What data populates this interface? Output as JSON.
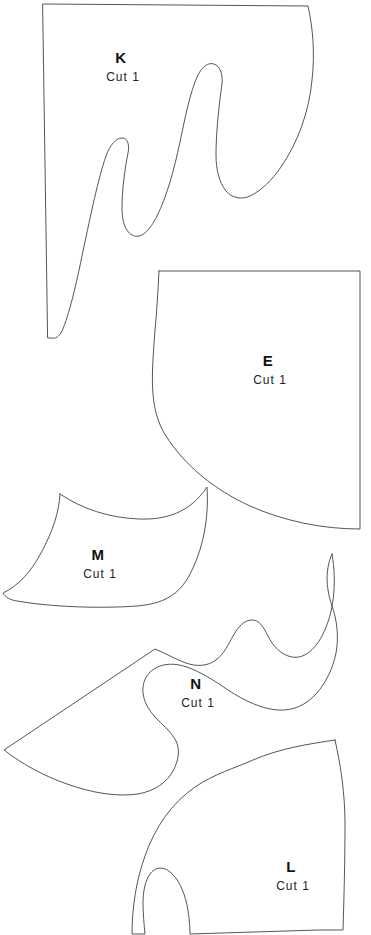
{
  "sheet": {
    "title": "Pattern Pieces Sheet",
    "background_color": "#ffffff",
    "line_color": "#555555",
    "text_color": "#111111",
    "width": 371,
    "height": 935
  },
  "pieces": [
    {
      "id": "piece-k",
      "letter": "K",
      "cut_note": "Cut 1",
      "letter_x": 121,
      "letter_y": 63,
      "cut_x": 123,
      "cut_y": 81,
      "path": "M 43 4 L 308 6 C 313 28 315 54 312 80 C 309 112 298 142 281 167 C 272 180 261 191 250 196 C 241 200 232 198 226 191 C 219 182 216 169 216 155 C 216 132 219 105 222 84 C 223 74 220 66 214 64 C 208 62 202 67 198 75 C 190 92 185 118 180 142 C 174 170 167 196 157 216 C 150 230 141 240 132 235 C 125 231 122 221 122 208 C 122 189 125 168 128 153 C 130 144 127 138 122 138 C 116 138 110 145 106 156 C 98 179 91 214 83 251 C 76 286 69 315 62 331 C 59 337 55 339 52 338 L 48 338 Z"
    },
    {
      "id": "piece-e",
      "letter": "E",
      "cut_note": "Cut 1",
      "letter_x": 268,
      "letter_y": 366,
      "cut_x": 270,
      "cut_y": 384,
      "path": "M 159 271 L 360 271 L 360 529 C 322 529 284 521 250 506 C 215 490 185 466 166 436 C 148 408 152 373 155 330 C 157 310 158 290 159 271 Z"
    },
    {
      "id": "piece-m",
      "letter": "M",
      "cut_note": "Cut 1",
      "letter_x": 98,
      "letter_y": 560,
      "cut_x": 100,
      "cut_y": 578,
      "path": "M 60 494 C 82 509 110 518 139 519 C 165 520 190 513 207 487 C 209 519 203 550 189 576 C 173 605 147 606 117 607 C 83 608 46 606 17 601 C 10 600 5 597 3 593 C 18 586 31 572 41 553 C 53 531 59 512 60 494 Z"
    },
    {
      "id": "piece-n",
      "letter": "N",
      "cut_note": "Cut 1",
      "letter_x": 196,
      "letter_y": 689,
      "cut_x": 198,
      "cut_y": 707,
      "path": "M 332 554 C 337 583 334 613 322 636 C 314 651 303 659 292 657 C 281 655 273 646 268 636 C 263 626 259 620 252 620 C 244 620 238 627 233 636 C 228 645 224 654 216 660 C 208 666 197 667 186 663 C 175 659 165 653 155 649 L 4 750 C 22 764 44 776 67 784 C 92 793 117 797 138 794 C 155 791 167 782 173 771 C 179 760 180 749 176 741 C 172 733 165 727 158 720 C 150 712 144 703 143 693 C 142 683 146 674 154 669 C 163 663 175 663 187 667 C 201 672 215 681 228 690 C 245 701 262 709 278 710 C 293 711 306 705 316 694 C 326 683 333 668 336 653 C 339 637 337 620 332 606 C 327 591 324 572 332 554 Z"
    },
    {
      "id": "piece-l",
      "letter": "L",
      "cut_note": "Cut 1",
      "letter_x": 291,
      "letter_y": 872,
      "cut_x": 293,
      "cut_y": 890,
      "path": "M 335 740 C 341 766 345 795 345 824 C 345 860 344 898 343 930 L 318 930 L 190 934 C 190 925 189 915 187 905 C 184 891 178 878 170 872 C 163 866 155 867 150 874 C 145 881 143 892 143 903 C 143 913 144 924 145 934 L 132 934 C 132 908 136 881 145 856 C 155 827 172 803 195 787 C 214 774 235 768 253 760 C 281 748 309 744 335 740 Z"
    }
  ]
}
